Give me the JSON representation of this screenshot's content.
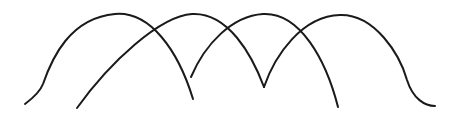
{
  "drawing": {
    "background": "#ffffff",
    "stroke_color": "#1a1a1a",
    "width": 456,
    "height": 117,
    "arcs": [
      {
        "name": "arc-1",
        "d": "M25,104 C33,98 40,92 43,84 C52,58 70,18 115,14 C150,11 178,50 193,99"
      },
      {
        "name": "arc-2",
        "d": "M77,108 C110,62 160,16 192,14 C228,12 252,55 264,87"
      },
      {
        "name": "arc-3",
        "d": "M191,77 C205,44 232,16 263,14 C300,12 326,60 338,107"
      },
      {
        "name": "arc-4",
        "d": "M264,87 C275,55 302,16 340,15 C375,14 400,55 407,80 C413,99 425,106 435,106"
      }
    ]
  }
}
